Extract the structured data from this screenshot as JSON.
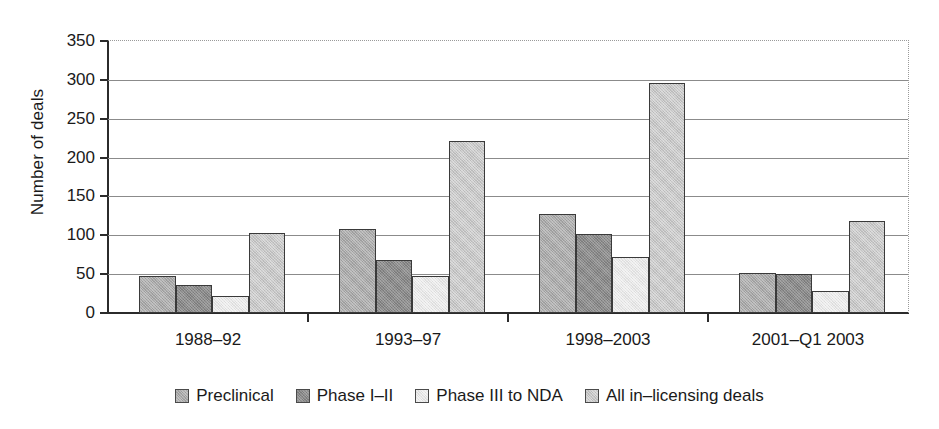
{
  "chart_data": {
    "type": "bar",
    "title": "",
    "xlabel": "",
    "ylabel": "Number of deals",
    "categories": [
      "1988–92",
      "1993–97",
      "1998–2003",
      "2001–Q1 2003"
    ],
    "series": [
      {
        "name": "Preclinical",
        "color": "#a9a9a9",
        "values": [
          47,
          108,
          127,
          51
        ]
      },
      {
        "name": "Phase I–II",
        "color": "#8a8a8a",
        "values": [
          36,
          68,
          102,
          50
        ]
      },
      {
        "name": "Phase III to NDA",
        "color": "#e6e6e6",
        "values": [
          22,
          48,
          72,
          28
        ]
      },
      {
        "name": "All in–licensing deals",
        "color": "#c6c6c6",
        "values": [
          103,
          221,
          296,
          119
        ]
      }
    ],
    "ylim": [
      0,
      350
    ],
    "ytick_values": [
      0,
      50,
      100,
      150,
      200,
      250,
      300,
      350
    ],
    "ytick_labels": [
      "0",
      "50",
      "100",
      "150",
      "200",
      "250",
      "300",
      "350"
    ],
    "grid": true,
    "legend_position": "bottom"
  }
}
